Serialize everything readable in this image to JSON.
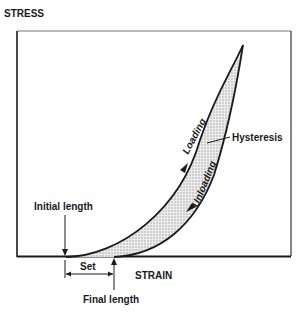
{
  "diagram": {
    "y_axis_label": "STRESS",
    "x_axis_label": "STRAIN",
    "curves": {
      "loading_label": "Loading",
      "unloading_label": "Unloading",
      "region_label": "Hysteresis"
    },
    "annotations": {
      "initial_length": "Initial length",
      "final_length": "Final length",
      "set": "Set"
    },
    "colors": {
      "line": "#1a1a1a",
      "fill": "#d9d9d9",
      "background": "#ffffff"
    }
  }
}
